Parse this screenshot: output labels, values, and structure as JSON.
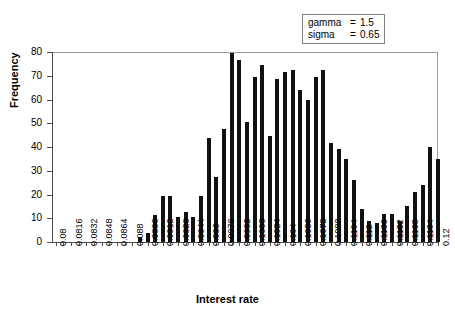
{
  "chart_data": {
    "type": "bar",
    "title": "",
    "xlabel": "Interest rate",
    "ylabel": "Frequency",
    "ylim": [
      0,
      80
    ],
    "ytick_labels": [
      "0",
      "10",
      "20",
      "30",
      "40",
      "50",
      "60",
      "70",
      "80"
    ],
    "ytick_values": [
      0,
      10,
      20,
      30,
      40,
      50,
      60,
      70,
      80
    ],
    "grid": false,
    "legend_position": "top-right",
    "bin_width": 0.0008,
    "xtick_labels": [
      "0.08",
      "0.0816",
      "0.0832",
      "0.0848",
      "0.0864",
      "0.088",
      "0.0896",
      "0.0912",
      "0.0928",
      "0.0944",
      "0.096",
      "0.0976",
      "0.0992",
      "0.1008",
      "0.1024",
      "0.104",
      "0.1056",
      "0.1072",
      "0.1088",
      "0.1104",
      "0.112",
      "0.1136",
      "0.1152",
      "0.1168",
      "0.1184",
      "0.12"
    ],
    "xtick_label_step": 2,
    "categories": [
      "0.08",
      "0.0808",
      "0.0816",
      "0.0824",
      "0.0832",
      "0.084",
      "0.0848",
      "0.0856",
      "0.0864",
      "0.0872",
      "0.088",
      "0.0888",
      "0.0896",
      "0.0904",
      "0.0912",
      "0.092",
      "0.0928",
      "0.0936",
      "0.0944",
      "0.0952",
      "0.096",
      "0.0968",
      "0.0976",
      "0.0984",
      "0.0992",
      "0.1",
      "0.1008",
      "0.1016",
      "0.1024",
      "0.1032",
      "0.104",
      "0.1048",
      "0.1056",
      "0.1064",
      "0.1072",
      "0.108",
      "0.1088",
      "0.1096",
      "0.1104",
      "0.1112",
      "0.112",
      "0.1128",
      "0.1136",
      "0.1144",
      "0.1152",
      "0.116",
      "0.1168",
      "0.1176",
      "0.1184",
      "0.1192",
      "0.12"
    ],
    "values": [
      0,
      0,
      0,
      0,
      0,
      0,
      0,
      0,
      0,
      0,
      0,
      2,
      4,
      11.5,
      19.5,
      19.5,
      10.5,
      12.5,
      10.5,
      19.5,
      44,
      27.5,
      47.5,
      79.5,
      76.5,
      50.5,
      69.5,
      74.5,
      44.5,
      68.5,
      71.5,
      72.5,
      64,
      60,
      69.5,
      72.5,
      41.5,
      39,
      35,
      26,
      14,
      9,
      8,
      12,
      12,
      9,
      15,
      21,
      24,
      40,
      35
    ],
    "bar_color": "#111111"
  },
  "legend": {
    "rows": [
      {
        "name": "gamma",
        "eq": "=",
        "value": "1.5"
      },
      {
        "name": "sigma",
        "eq": "=",
        "value": "0.65"
      }
    ]
  }
}
